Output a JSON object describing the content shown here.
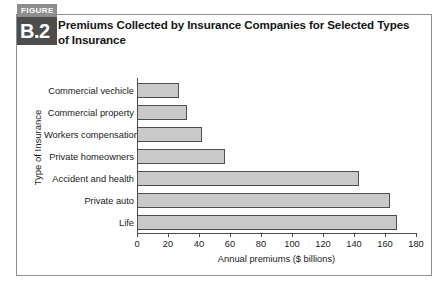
{
  "figure": {
    "badge_word": "FIGURE",
    "badge_number": "B.2",
    "title": "Premiums Collected by Insurance Companies for Selected Types of Insurance"
  },
  "colors": {
    "bar_fill": "#c9c9c9",
    "bar_border": "#4f4f4f",
    "badge_word_bg": "#8d8d8d",
    "badge_num_bg": "#4d4d4d",
    "frame_border": "#8e8e8e",
    "axis": "#4a4a4a"
  },
  "chart_data": {
    "type": "bar",
    "orientation": "horizontal",
    "title": "Premiums Collected by Insurance Companies for Selected Types of Insurance",
    "xlabel": "Annual premiums ($ billions)",
    "ylabel": "Type of Insurance",
    "categories": [
      "Commercial vechicle",
      "Commercial property",
      "Workers compensation",
      "Private homeowners",
      "Accident and health",
      "Private auto",
      "Life"
    ],
    "values": [
      27,
      32,
      42,
      57,
      143,
      163,
      168
    ],
    "xlim": [
      0,
      180
    ],
    "xticks": [
      0,
      20,
      40,
      60,
      80,
      100,
      120,
      140,
      160,
      180
    ],
    "xtick_labels": [
      "0",
      "20",
      "40",
      "60",
      "80",
      "100",
      "120",
      "140",
      "160",
      "180"
    ],
    "grid": false,
    "legend": false
  }
}
